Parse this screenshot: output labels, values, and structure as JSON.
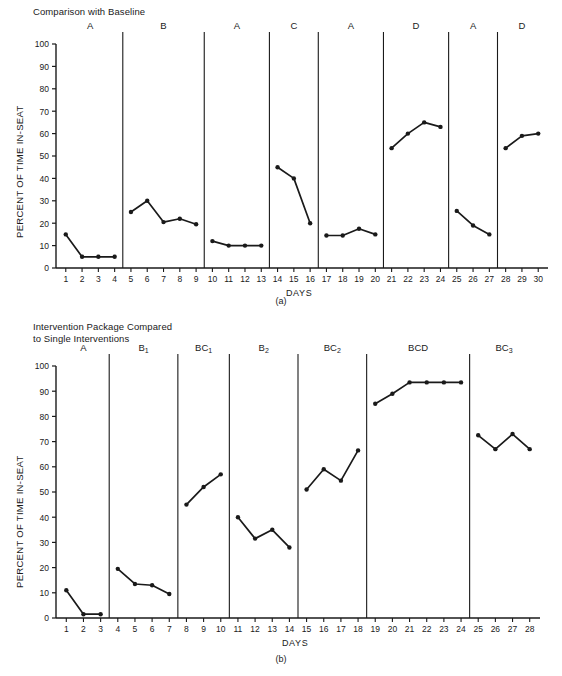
{
  "page": {
    "background": "#ffffff",
    "ink": "#1a1a1a"
  },
  "figures": [
    {
      "id": "a",
      "title": "Comparison with Baseline",
      "caption": "(a)"
    },
    {
      "id": "b",
      "title": "Intervention Package Compared\nto Single Interventions",
      "caption": "(b)"
    }
  ],
  "chart_data": [
    {
      "type": "line",
      "id": "chart-a",
      "title": "Comparison with Baseline",
      "caption": "(a)",
      "xlabel": "DAYS",
      "ylabel": "PERCENT OF TIME IN-SEAT",
      "xlim": [
        0.4,
        30.6
      ],
      "ylim": [
        0,
        100
      ],
      "yticks": [
        0,
        10,
        20,
        30,
        40,
        50,
        60,
        70,
        80,
        90,
        100
      ],
      "ytick_labels": [
        "0",
        "10",
        "20",
        "30",
        "40",
        "50",
        "60",
        "70",
        "80",
        "90",
        "100"
      ],
      "xticks": [
        1,
        2,
        3,
        4,
        5,
        6,
        7,
        8,
        9,
        10,
        11,
        12,
        13,
        14,
        15,
        16,
        17,
        18,
        19,
        20,
        21,
        22,
        23,
        24,
        25,
        26,
        27,
        28,
        29,
        30
      ],
      "xtick_labels": [
        "1",
        "2",
        "3",
        "4",
        "5",
        "6",
        "7",
        "8",
        "9",
        "10",
        "11",
        "12",
        "13",
        "14",
        "15",
        "16",
        "17",
        "18",
        "19",
        "20",
        "21",
        "22",
        "23",
        "24",
        "25",
        "26",
        "27",
        "28",
        "29",
        "30"
      ],
      "grid": false,
      "legend": "none",
      "marker": "filled-circle",
      "phase_dividers": [
        4.5,
        9.5,
        13.5,
        16.5,
        20.5,
        24.5,
        27.5
      ],
      "phases": [
        {
          "label": "A",
          "label_center_day": 2.5,
          "x": [
            1,
            2,
            3,
            4
          ],
          "y": [
            15,
            5,
            5,
            5
          ]
        },
        {
          "label": "B",
          "label_center_day": 7,
          "x": [
            5,
            6,
            7,
            8,
            9
          ],
          "y": [
            25,
            30,
            20.5,
            22,
            19.5
          ]
        },
        {
          "label": "A",
          "label_center_day": 11.5,
          "x": [
            10,
            11,
            12,
            13
          ],
          "y": [
            12,
            10,
            10,
            10
          ]
        },
        {
          "label": "C",
          "label_center_day": 15,
          "x": [
            14,
            15,
            16
          ],
          "y": [
            45,
            40,
            20
          ]
        },
        {
          "label": "A",
          "label_center_day": 18.5,
          "x": [
            17,
            18,
            19,
            20
          ],
          "y": [
            14.5,
            14.5,
            17.5,
            15
          ]
        },
        {
          "label": "D",
          "label_center_day": 22.5,
          "x": [
            21,
            22,
            23,
            24
          ],
          "y": [
            53.5,
            60,
            65,
            63
          ]
        },
        {
          "label": "A",
          "label_center_day": 26,
          "x": [
            25,
            26,
            27
          ],
          "y": [
            25.5,
            19,
            15
          ]
        },
        {
          "label": "D",
          "label_center_day": 29,
          "x": [
            28,
            29,
            30
          ],
          "y": [
            53.5,
            59,
            60
          ]
        }
      ]
    },
    {
      "type": "line",
      "id": "chart-b",
      "title": "Intervention Package Compared to Single Interventions",
      "caption": "(b)",
      "xlabel": "DAYS",
      "ylabel": "PERCENT OF TIME IN-SEAT",
      "xlim": [
        0.4,
        28.6
      ],
      "ylim": [
        0,
        100
      ],
      "yticks": [
        0,
        10,
        20,
        30,
        40,
        50,
        60,
        70,
        80,
        90,
        100
      ],
      "ytick_labels": [
        "0",
        "10",
        "20",
        "30",
        "40",
        "50",
        "60",
        "70",
        "80",
        "90",
        "100"
      ],
      "xticks": [
        1,
        2,
        3,
        4,
        5,
        6,
        7,
        8,
        9,
        10,
        11,
        12,
        13,
        14,
        15,
        16,
        17,
        18,
        19,
        20,
        21,
        22,
        23,
        24,
        25,
        26,
        27,
        28
      ],
      "xtick_labels": [
        "1",
        "2",
        "3",
        "4",
        "5",
        "6",
        "7",
        "8",
        "9",
        "10",
        "11",
        "12",
        "13",
        "14",
        "15",
        "16",
        "17",
        "18",
        "19",
        "20",
        "21",
        "22",
        "23",
        "24",
        "25",
        "26",
        "27",
        "28"
      ],
      "grid": false,
      "legend": "none",
      "marker": "filled-circle",
      "phase_dividers": [
        3.5,
        7.5,
        10.5,
        14.5,
        18.5,
        24.5
      ],
      "phases": [
        {
          "label": "A",
          "label_sub": "",
          "label_center_day": 2,
          "x": [
            1,
            2,
            3
          ],
          "y": [
            11,
            1.5,
            1.5
          ]
        },
        {
          "label": "B",
          "label_sub": "1",
          "label_center_day": 5.5,
          "x": [
            4,
            5,
            6,
            7
          ],
          "y": [
            19.5,
            13.5,
            13,
            9.5
          ]
        },
        {
          "label": "BC",
          "label_sub": "1",
          "label_center_day": 9,
          "x": [
            8,
            9,
            10
          ],
          "y": [
            45,
            52,
            57
          ]
        },
        {
          "label": "B",
          "label_sub": "2",
          "label_center_day": 12.5,
          "x": [
            11,
            12,
            13,
            14
          ],
          "y": [
            40,
            31.5,
            35,
            28
          ]
        },
        {
          "label": "BC",
          "label_sub": "2",
          "label_center_day": 16.5,
          "x": [
            15,
            16,
            17,
            18
          ],
          "y": [
            51,
            59,
            54.5,
            66.5
          ]
        },
        {
          "label": "BCD",
          "label_sub": "",
          "label_center_day": 21.5,
          "x": [
            19,
            20,
            21,
            22,
            23,
            24
          ],
          "y": [
            85,
            89,
            93.5,
            93.5,
            93.5,
            93.5
          ]
        },
        {
          "label": "BC",
          "label_sub": "3",
          "label_center_day": 26.5,
          "x": [
            25,
            26,
            27,
            28
          ],
          "y": [
            72.5,
            67,
            73,
            67
          ]
        }
      ]
    }
  ]
}
